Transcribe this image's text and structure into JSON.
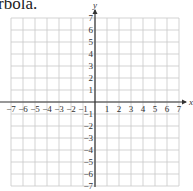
{
  "caption": "rbola.",
  "chart_data": {
    "type": "scatter",
    "title": "",
    "xlabel": "x",
    "ylabel": "y",
    "xlim": [
      -7,
      7
    ],
    "ylim": [
      -7,
      7
    ],
    "grid": true,
    "x_ticks": [
      "−7",
      "−6",
      "−5",
      "−4",
      "−3",
      "−2",
      "−1",
      "1",
      "2",
      "3",
      "4",
      "5",
      "6",
      "7"
    ],
    "y_ticks": [
      "7",
      "6",
      "5",
      "4",
      "3",
      "2",
      "1",
      "−1",
      "−2",
      "−3",
      "−4",
      "−5",
      "−6",
      "−7"
    ],
    "series": []
  },
  "colors": {
    "grid": "#c8c8c8",
    "axis": "#333333"
  }
}
